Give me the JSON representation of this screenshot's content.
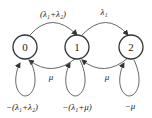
{
  "diagram": {
    "type": "markov-chain-state-transition",
    "states": [
      {
        "id": "0",
        "label": "0",
        "self_loop": "−(λ₁+λ₂)"
      },
      {
        "id": "1",
        "label": "1",
        "self_loop": "−(λ₁+μ)"
      },
      {
        "id": "2",
        "label": "2",
        "self_loop": "−μ"
      }
    ],
    "transitions": [
      {
        "from": "0",
        "to": "1",
        "label": "(λ₁+λ₂)"
      },
      {
        "from": "1",
        "to": "2",
        "label": "λ₁"
      },
      {
        "from": "1",
        "to": "0",
        "label": "μ"
      },
      {
        "from": "2",
        "to": "1",
        "label": "μ"
      }
    ]
  }
}
